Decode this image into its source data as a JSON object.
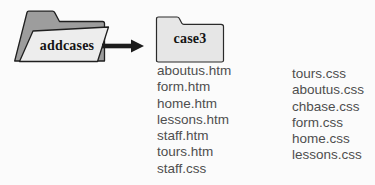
{
  "folders": {
    "source": {
      "label": "addcases"
    },
    "target": {
      "label": "case3"
    }
  },
  "files": {
    "htm_column": [
      "aboutus.htm",
      "form.htm",
      "home.htm",
      "lessons.htm",
      "staff.htm",
      "tours.htm",
      "staff.css"
    ],
    "css_column": [
      "tours.css",
      "aboutus.css",
      "chbase.css",
      "form.css",
      "home.css",
      "lessons.css"
    ]
  },
  "colors": {
    "folder_back": "#9d9d9d",
    "folder_front": "#ededed",
    "target_folder_fill": "#e6e6e6",
    "outline": "#1f1f1f",
    "arrow": "#1c1c1c",
    "file_text": "#4e4e4e",
    "label_text": "#141414",
    "background": "#fbfbfb"
  }
}
